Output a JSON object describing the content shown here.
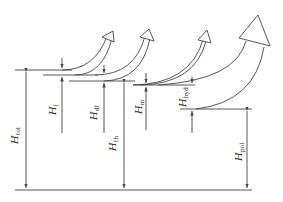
{
  "diagram": {
    "type": "energy head loss cascade",
    "stroke_color": "#444444",
    "background": "#ffffff",
    "labels": [
      {
        "id": "tot",
        "main": "H",
        "sub": "tot"
      },
      {
        "id": "l",
        "main": "H",
        "sub": "l"
      },
      {
        "id": "df",
        "main": "H",
        "sub": "df"
      },
      {
        "id": "th",
        "main": "H",
        "sub": "th"
      },
      {
        "id": "m",
        "main": "H",
        "sub": "m"
      },
      {
        "id": "hyd",
        "main": "H",
        "sub": "hyd"
      },
      {
        "id": "pol",
        "main": "H",
        "sub": "pol"
      }
    ]
  }
}
